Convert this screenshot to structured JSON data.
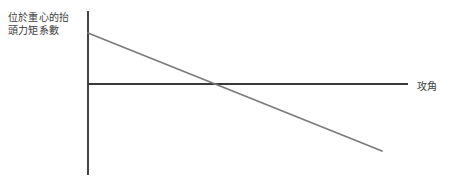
{
  "figure": {
    "width": 452,
    "height": 180,
    "background_color": "#ffffff",
    "axis_color": "#3a3a3a",
    "curve_color": "#7a7a7a",
    "text_color": "#3c3c3c"
  },
  "labels": {
    "y_axis": "位於重心的抬\n頭力矩系數",
    "y_axis_line1": "位於重心的抬",
    "y_axis_line2": "頭力矩系數",
    "x_axis": "攻角"
  },
  "chart_data": {
    "type": "line",
    "title": "",
    "subtitle": "",
    "xlabel": "攻角",
    "ylabel": "位於重心的抬頭力矩系數",
    "grid": false,
    "legend": false,
    "legend_position": "none",
    "axis_style": "origin-crossed",
    "xlim": [
      0,
      1
    ],
    "ylim": [
      -1,
      1
    ],
    "x_tick_labels": [],
    "y_tick_labels": [],
    "annotations": [],
    "series": [
      {
        "name": "位於重心的抬頭力矩系數",
        "color": "#7a7a7a",
        "x": [
          0.0,
          1.0
        ],
        "y": [
          0.62,
          -0.7
        ],
        "x_intercept": 0.47,
        "y_intercept": 0.62,
        "slope": -1.32,
        "description": "負斜率直線，代表靜穩定"
      }
    ],
    "geometry": {
      "y_axis_x": 88,
      "y_axis_top": 11,
      "y_axis_bottom": 175,
      "x_axis_y": 84,
      "x_axis_left": 88,
      "x_axis_right": 408,
      "curve_start": [
        88,
        33
      ],
      "curve_end": [
        382,
        151
      ],
      "curve_zero_crossing": [
        232,
        84
      ]
    }
  }
}
